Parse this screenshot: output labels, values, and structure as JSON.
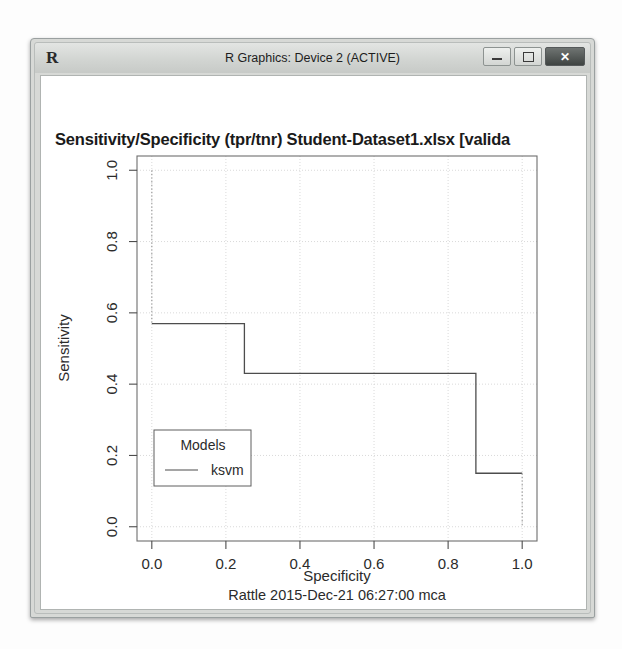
{
  "window": {
    "title": "R Graphics: Device 2 (ACTIVE)",
    "logo": "R",
    "buttons": {
      "minimize": "minimize",
      "maximize": "maximize",
      "close": "✕"
    }
  },
  "plot": {
    "title": "Sensitivity/Specificity (tpr/tnr)  Student-Dataset1.xlsx [valida",
    "xlabel": "Specificity",
    "ylabel": "Sensitivity",
    "subtitle": "Rattle 2015-Dec-21 06:27:00 mca",
    "legend": {
      "title": "Models",
      "entries": [
        "ksvm"
      ]
    }
  },
  "chart_data": {
    "type": "line",
    "title": "Sensitivity/Specificity (tpr/tnr)  Student-Dataset1.xlsx [valida",
    "subtitle": "Rattle 2015-Dec-21 06:27:00 mca",
    "xlabel": "Specificity",
    "ylabel": "Sensitivity",
    "xlim": [
      -0.04,
      1.04
    ],
    "ylim": [
      -0.04,
      1.04
    ],
    "xticks": [
      "0.0",
      "0.2",
      "0.4",
      "0.6",
      "0.8",
      "1.0"
    ],
    "xtick_values": [
      0.0,
      0.2,
      0.4,
      0.6,
      0.8,
      1.0
    ],
    "yticks": [
      "0.0",
      "0.2",
      "0.4",
      "0.6",
      "0.8",
      "1.0"
    ],
    "ytick_values": [
      0.0,
      0.2,
      0.4,
      0.6,
      0.8,
      1.0
    ],
    "grid": true,
    "legend_position": "bottom-left",
    "legend_title": "Models",
    "series": [
      {
        "name": "ksvm",
        "style": "step",
        "color": "#4d4d4d",
        "x": [
          0.0,
          0.25,
          0.25,
          0.875,
          0.875,
          1.0
        ],
        "y": [
          0.57,
          0.57,
          0.43,
          0.43,
          0.15,
          0.15
        ]
      },
      {
        "name": "ksvm-dotted-start",
        "style": "dotted-vertical",
        "color": "#9a9a9a",
        "x": [
          0.0,
          0.0
        ],
        "y": [
          1.0,
          0.57
        ]
      },
      {
        "name": "ksvm-dotted-end",
        "style": "dotted-vertical",
        "color": "#9a9a9a",
        "x": [
          1.0,
          1.0
        ],
        "y": [
          0.15,
          0.0
        ]
      }
    ]
  }
}
